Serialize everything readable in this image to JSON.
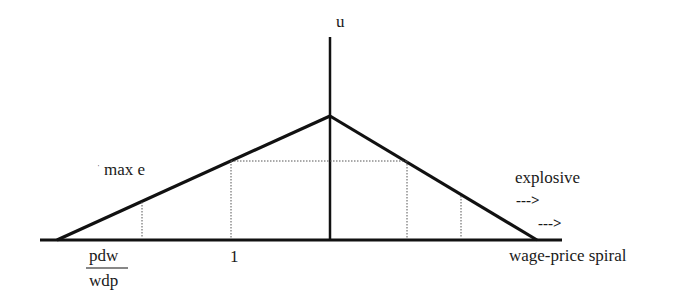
{
  "diagram": {
    "type": "economic-diagram",
    "axis_labels": {
      "vertical": "u",
      "horizontal_right": "wage-price spiral"
    },
    "annotations": {
      "max_e": "max e",
      "max_e_tick": "ˈ",
      "explosive": "explosive",
      "arrow_1": "--->",
      "arrow_2": "--->",
      "tick_one": "1",
      "fraction_numerator": "pdw",
      "fraction_denominator": "wdp"
    },
    "colors": {
      "line": "#111111",
      "dotted": "#555555",
      "background": "#ffffff"
    }
  }
}
